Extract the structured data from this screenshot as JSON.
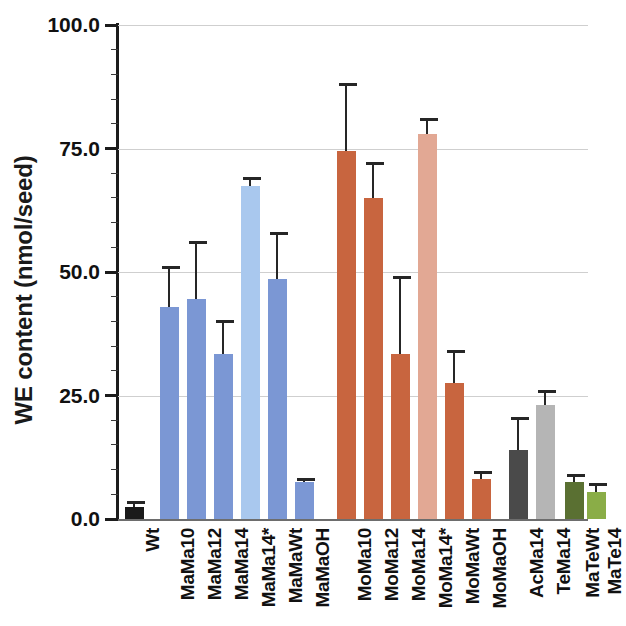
{
  "chart_data": {
    "type": "bar",
    "title": "",
    "xlabel": "",
    "ylabel": "WE content (nmol/seed)",
    "ylim": [
      0,
      100
    ],
    "yticks": [
      "0.0",
      "25.0",
      "50.0",
      "75.0",
      "100.0"
    ],
    "ytick_values": [
      0,
      25,
      50,
      75,
      100
    ],
    "grid": "horizontal",
    "legend": "none",
    "error_bars": "upper-only (SD)",
    "categories": [
      "Wt",
      "MaMa10",
      "MaMa12",
      "MaMa14",
      "MaMa14*",
      "MaMaWt",
      "MaMaOH",
      "MoMa10",
      "MoMa12",
      "MoMa14",
      "MoMa14*",
      "MoMaWt",
      "MoMaOH",
      "AcMa14",
      "TeMa14",
      "MaTeWt",
      "MaTe14"
    ],
    "values": [
      2.5,
      43.0,
      44.5,
      33.5,
      67.5,
      48.5,
      7.5,
      74.5,
      65.0,
      33.5,
      78.0,
      27.5,
      8.0,
      14.0,
      23.0,
      7.5,
      5.5
    ],
    "errors": [
      1.0,
      8.0,
      11.5,
      6.5,
      1.5,
      9.5,
      0.5,
      13.5,
      7.0,
      15.5,
      3.0,
      6.5,
      1.5,
      6.5,
      3.0,
      1.5,
      1.5
    ],
    "colors": [
      "#1a1a1a",
      "#7b97d4",
      "#7b97d4",
      "#7b97d4",
      "#a9c8ee",
      "#7b97d4",
      "#7b97d4",
      "#c8653f",
      "#c8653f",
      "#c8653f",
      "#e2a894",
      "#c8653f",
      "#c8653f",
      "#4a4a4a",
      "#b5b5b5",
      "#5a7032",
      "#8aad47"
    ],
    "groups": [
      {
        "name": "wild type",
        "categories": [
          "Wt"
        ]
      },
      {
        "name": "MaMa series",
        "categories": [
          "MaMa10",
          "MaMa12",
          "MaMa14",
          "MaMa14*",
          "MaMaWt",
          "MaMaOH"
        ]
      },
      {
        "name": "MoMa series",
        "categories": [
          "MoMa10",
          "MoMa12",
          "MoMa14",
          "MoMa14*",
          "MoMaWt",
          "MoMaOH"
        ]
      },
      {
        "name": "Ac/Te series",
        "categories": [
          "AcMa14",
          "TeMa14"
        ]
      },
      {
        "name": "MaTe series",
        "categories": [
          "MaTeWt",
          "MaTe14"
        ]
      }
    ]
  },
  "axis": {
    "y_title": "WE content (nmol/seed)"
  }
}
